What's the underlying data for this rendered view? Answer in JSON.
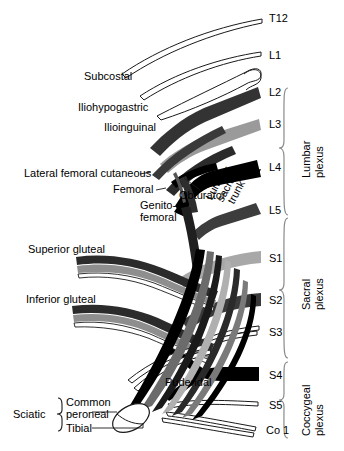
{
  "figure": {
    "type": "anatomical-diagram"
  },
  "vertebral_levels": [
    {
      "id": "t12",
      "label": "T12",
      "y": 18
    },
    {
      "id": "l1",
      "label": "L1",
      "y": 55
    },
    {
      "id": "l2",
      "label": "L2",
      "y": 92
    },
    {
      "id": "l3",
      "label": "L3",
      "y": 124
    },
    {
      "id": "l4",
      "label": "L4",
      "y": 167
    },
    {
      "id": "l5",
      "label": "L5",
      "y": 210
    },
    {
      "id": "s1",
      "label": "S1",
      "y": 258
    },
    {
      "id": "s2",
      "label": "S2",
      "y": 300
    },
    {
      "id": "s3",
      "label": "S3",
      "y": 332
    },
    {
      "id": "s4",
      "label": "S4",
      "y": 375
    },
    {
      "id": "s5",
      "label": "S5",
      "y": 405
    },
    {
      "id": "co1",
      "label": "Co 1",
      "y": 430
    }
  ],
  "nerve_labels": [
    {
      "id": "subcostal",
      "label": "Subcostal"
    },
    {
      "id": "iliohypogastric",
      "label": "Iliohypogastric"
    },
    {
      "id": "ilioinguinal",
      "label": "Ilioinguinal"
    },
    {
      "id": "lateral-femoral-cutaneous",
      "label": "Lateral femoral cutaneous"
    },
    {
      "id": "femoral",
      "label": "Femoral"
    },
    {
      "id": "obturator",
      "label": "Obturator"
    },
    {
      "id": "genitofemoral-line1",
      "label": "Genito-"
    },
    {
      "id": "genitofemoral-line2",
      "label": "femoral"
    },
    {
      "id": "lumbosacral-trunk",
      "label": "Lumbo-\nsacral\ntrunk"
    },
    {
      "id": "superior-gluteal",
      "label": "Superior gluteal"
    },
    {
      "id": "inferior-gluteal",
      "label": "Inferior gluteal"
    },
    {
      "id": "pudendal",
      "label": "Pudendal"
    },
    {
      "id": "sciatic",
      "label": "Sciatic"
    },
    {
      "id": "common-peroneal-line1",
      "label": "Common"
    },
    {
      "id": "common-peroneal-line2",
      "label": "peroneal"
    },
    {
      "id": "tibial",
      "label": "Tibial"
    }
  ],
  "lumbosacral_trunk": {
    "line1": "Lumbo-",
    "line2": "sacral",
    "line3": "trunk"
  },
  "plexus_groups": [
    {
      "id": "lumbar-plexus",
      "line1": "Lumbar",
      "line2": "plexus",
      "top": 88,
      "bottom": 215
    },
    {
      "id": "sacral-plexus",
      "line1": "Sacral",
      "line2": "plexus",
      "top": 218,
      "bottom": 358
    },
    {
      "id": "coccygeal-plexus",
      "line1": "Coccygeal",
      "line2": "plexus",
      "top": 362,
      "bottom": 438
    }
  ],
  "colors": {
    "black": "#000000",
    "dark_gray": "#333333",
    "mid_dark_gray": "#4a4a4a",
    "mid_gray": "#7d7d7d",
    "light_gray": "#a8a8a8",
    "pale_gray": "#c8c8c8",
    "outline": "#1a1a1a",
    "brace": "#808080",
    "background": "#ffffff"
  }
}
